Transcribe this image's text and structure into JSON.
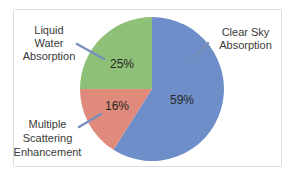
{
  "chart_data": {
    "type": "pie",
    "title": "",
    "start_angle_deg": 0,
    "direction": "clockwise",
    "legend_position": "callouts",
    "leader_line_color": "#7b8fbd",
    "slices": [
      {
        "label": "Clear Sky Absorption",
        "value": 59,
        "percent_label": "59%",
        "color": "#6d8ec9"
      },
      {
        "label": "Multiple Scattering Enhancement",
        "value": 16,
        "percent_label": "16%",
        "color": "#e08a7b"
      },
      {
        "label": "Liquid Water Absorption",
        "value": 25,
        "percent_label": "25%",
        "color": "#8fc077"
      }
    ]
  },
  "callouts": {
    "liquid": {
      "lines": [
        "Liquid",
        "Water",
        "Absorption"
      ]
    },
    "clear": {
      "lines": [
        "Clear Sky",
        "Absorption"
      ]
    },
    "multiple": {
      "lines": [
        "Multiple",
        "Scattering",
        "Enhancement"
      ]
    }
  }
}
